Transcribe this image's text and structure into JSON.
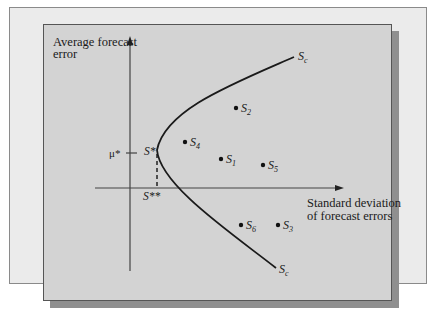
{
  "diagram": {
    "y_axis_label_line1": "Average forecast",
    "y_axis_label_line2": "error",
    "x_axis_label_line1": "Standard deviation",
    "x_axis_label_line2": "of forecast errors",
    "mu_star_label": "μ*",
    "s_star_label": "S*",
    "s_double_star_label": "S**",
    "curve_top_label": {
      "base": "S",
      "sub": "c"
    },
    "curve_bottom_label": {
      "base": "S",
      "sub": "c"
    },
    "points": [
      {
        "base": "S",
        "sub": "1"
      },
      {
        "base": "S",
        "sub": "2"
      },
      {
        "base": "S",
        "sub": "3"
      },
      {
        "base": "S",
        "sub": "4"
      },
      {
        "base": "S",
        "sub": "5"
      },
      {
        "base": "S",
        "sub": "6"
      }
    ],
    "colors": {
      "back_panel": "#ebebeb",
      "front_panel": "#d3d3d3",
      "shadow": "#8f8f8f",
      "ink": "#1a1a1a"
    }
  }
}
